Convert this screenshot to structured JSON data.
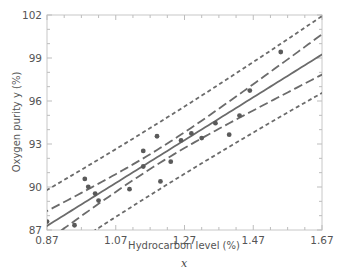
{
  "chart_data": {
    "type": "scatter",
    "title": "",
    "xlabel": "Hydrocarbon level (%)",
    "xlabel_var": "x",
    "ylabel": "Oxygen purity y (%)",
    "xlim": [
      0.87,
      1.67
    ],
    "ylim": [
      87,
      102
    ],
    "xticks": [
      "0.87",
      "1.07",
      "1.27",
      "1.47",
      "1.67"
    ],
    "yticks": [
      "87",
      "90",
      "93",
      "96",
      "99",
      "102"
    ],
    "grid": false,
    "legend": "none",
    "series": [
      {
        "name": "Observations",
        "kind": "points",
        "x": [
          0.99,
          1.02,
          1.15,
          1.29,
          1.46,
          1.36,
          0.87,
          1.23,
          1.55,
          1.4,
          1.19,
          1.15,
          0.98,
          1.01,
          1.11,
          1.2,
          1.26,
          1.32,
          1.43,
          0.95
        ],
        "y": [
          90.01,
          89.05,
          91.43,
          93.74,
          96.73,
          94.45,
          87.59,
          91.77,
          99.42,
          93.65,
          93.54,
          92.52,
          90.56,
          89.54,
          89.85,
          90.39,
          93.25,
          93.41,
          94.98,
          87.33
        ]
      },
      {
        "name": "Fitted regression line",
        "kind": "solid-line",
        "equation": "y = 74.283 + 14.947x"
      },
      {
        "name": "95% confidence limits on mean response",
        "kind": "long-dash"
      },
      {
        "name": "95% prediction limits",
        "kind": "short-dash"
      }
    ],
    "colors": {
      "line": "#6b6b6b",
      "point": "#5a5a5a",
      "axis": "#bdbdbd",
      "text": "#555555"
    }
  }
}
